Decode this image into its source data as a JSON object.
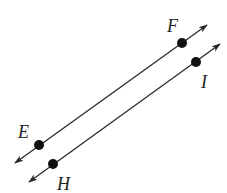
{
  "diagram": {
    "type": "parallel-lines",
    "colors": {
      "line": "#2a2a2a",
      "point": "#111111",
      "label": "#222222"
    },
    "lines": [
      {
        "name": "line-EF",
        "from": [
          15,
          163
        ],
        "to": [
          207,
          25
        ],
        "points": [
          {
            "label": "E",
            "x": 39,
            "y": 145,
            "label_x": 18,
            "label_y": 138
          },
          {
            "label": "F",
            "x": 182,
            "y": 43,
            "label_x": 167,
            "label_y": 32
          }
        ]
      },
      {
        "name": "line-HI",
        "from": [
          29,
          182
        ],
        "to": [
          220,
          44
        ],
        "points": [
          {
            "label": "H",
            "x": 53,
            "y": 164,
            "label_x": 57,
            "label_y": 190
          },
          {
            "label": "I",
            "x": 196,
            "y": 62,
            "label_x": 201,
            "label_y": 88
          }
        ]
      }
    ],
    "labels": {
      "E": "E",
      "F": "F",
      "H": "H",
      "I": "I"
    }
  }
}
